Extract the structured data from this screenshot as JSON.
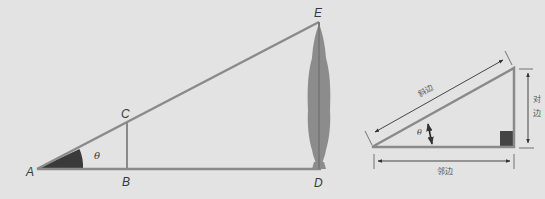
{
  "diagram": {
    "left_figure": {
      "points": {
        "A": "A",
        "B": "B",
        "C": "C",
        "D": "D",
        "E": "E"
      },
      "angle_label": "θ",
      "object": "tree"
    },
    "right_figure": {
      "angle_label": "θ",
      "hypotenuse_label": "斜边",
      "opposite_label_line1": "对",
      "opposite_label_line2": "边",
      "adjacent_label": "邻边"
    },
    "colors": {
      "background": "#e3e3e3",
      "line": "#8a8a8a",
      "angle_fill": "#3a3a3a",
      "tree": "#8c8c8c",
      "right_angle_marker": "#444444",
      "arrow": "#333333"
    }
  }
}
